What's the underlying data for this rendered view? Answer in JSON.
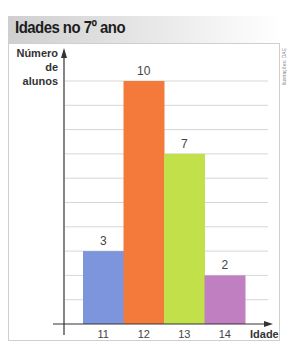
{
  "title": "Idades no 7º ano",
  "credit": "Ilustrações: DAE",
  "y_axis_label_line1": "Número",
  "y_axis_label_line2": "de alunos",
  "x_axis_label": "Idade",
  "colors": {
    "bar_11": "#7d95dd",
    "bar_12": "#f47a3c",
    "bar_13": "#c2e04a",
    "bar_14": "#c07fc0",
    "grid": "#d6d6d6",
    "axis": "#333333",
    "title_bg": "#cfcfcf"
  },
  "chart_data": {
    "type": "bar",
    "title": "Idades no 7º ano",
    "xlabel": "Idade",
    "ylabel": "Número de alunos",
    "categories": [
      "11",
      "12",
      "13",
      "14"
    ],
    "values": [
      3,
      10,
      7,
      2
    ],
    "data_labels": [
      "3",
      "10",
      "7",
      "2"
    ],
    "ylim": [
      0,
      10
    ],
    "grid": true,
    "grid_step": 1,
    "legend": null,
    "bar_gap": 0
  }
}
